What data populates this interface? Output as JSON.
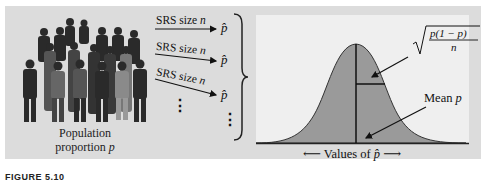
{
  "population": {
    "label_line1": "Population",
    "label_line2_prefix": "proportion ",
    "label_symbol": "p"
  },
  "samples": [
    {
      "label": "SRS size ",
      "symbol": "n",
      "result": "p̂"
    },
    {
      "label": "SRS size ",
      "symbol": "n",
      "result": "p̂"
    },
    {
      "label": "SRS size ",
      "symbol": "n",
      "result": "p̂"
    }
  ],
  "ellipsis": "⋮",
  "distribution": {
    "sd_formula_numerator": "p(1 − p)",
    "sd_formula_denominator": "n",
    "mean_label_prefix": "Mean ",
    "mean_symbol": "p",
    "axis_label_prefix": "Values of ",
    "axis_symbol": "p̂",
    "fill_color": "#9a9a9a",
    "background_color": "#efefef"
  },
  "figure_label": "FIGURE 5.10"
}
